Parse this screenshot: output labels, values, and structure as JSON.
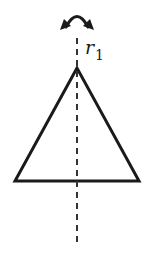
{
  "figure": {
    "type": "reflection-symmetry-diagram",
    "shape": "triangle",
    "axis": {
      "label_main": "r",
      "label_sub": "1",
      "style": "dashed",
      "orientation": "vertical"
    },
    "arrow": {
      "type": "curved-double-headed",
      "meaning": "reflection-flip"
    },
    "colors": {
      "stroke": "#1a1a1a",
      "dashed_axis": "#333333",
      "background": "#ffffff"
    }
  }
}
